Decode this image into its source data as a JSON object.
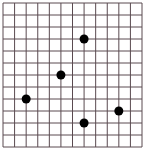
{
  "grid": {
    "columns": 12,
    "rows": 12,
    "left": 3,
    "top": 3,
    "right": 142,
    "bottom": 147,
    "line_color": "#5a4a50",
    "background": "#ffffff"
  },
  "points": [
    {
      "col": 7,
      "row": 3
    },
    {
      "col": 5,
      "row": 6
    },
    {
      "col": 2,
      "row": 8
    },
    {
      "col": 10,
      "row": 9
    },
    {
      "col": 7,
      "row": 10
    }
  ],
  "point_style": {
    "color": "#000000",
    "radius": 4.5
  }
}
